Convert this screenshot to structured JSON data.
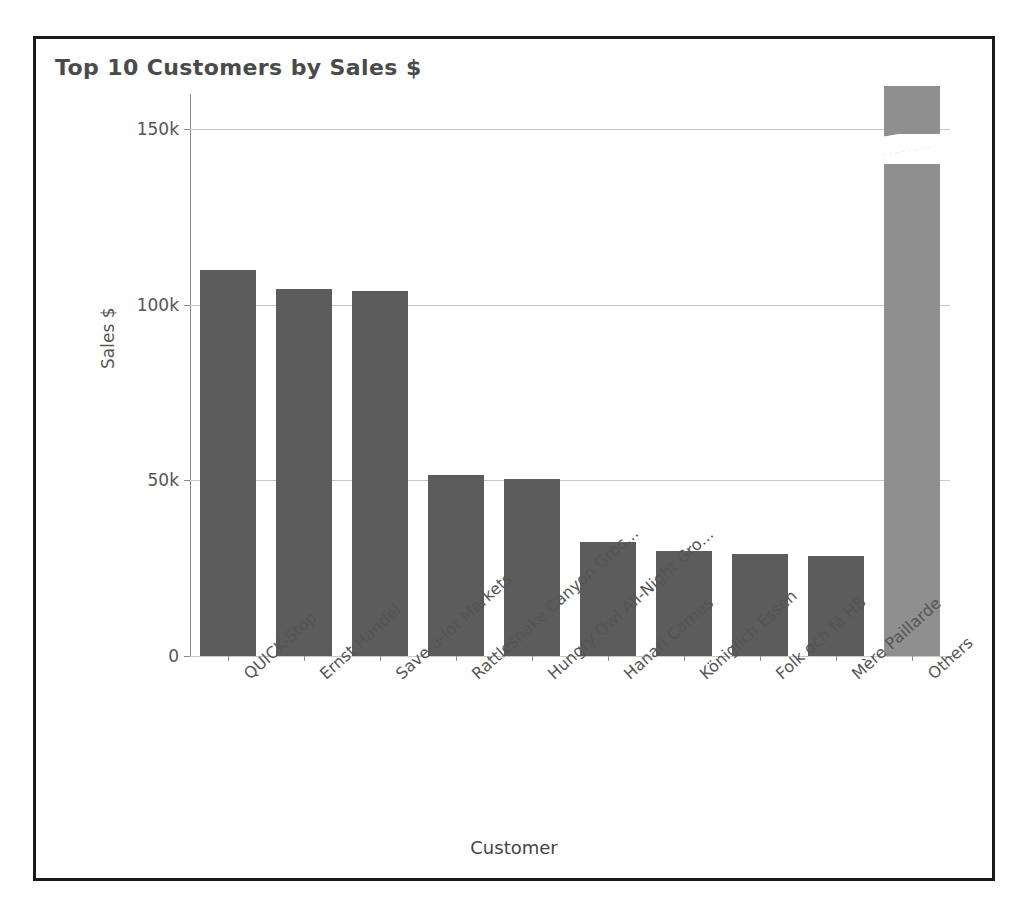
{
  "chart_data": {
    "type": "bar",
    "title": "Top 10 Customers by Sales $",
    "xlabel": "Customer",
    "ylabel": "Sales $",
    "categories": [
      "QUICK-Stop",
      "Ernst Handel",
      "Save-a-lot Markets",
      "Rattlesnake Canyon Groc...",
      "Hungry Owl All-Night Gro...",
      "Hanari Carnes",
      "Königlich Essen",
      "Folk och fä HB",
      "Mère Paillarde",
      "Others"
    ],
    "values": [
      110000,
      104500,
      104000,
      51500,
      50500,
      32500,
      30000,
      29000,
      28500,
      465000
    ],
    "ylim": [
      0,
      160000
    ],
    "yticks": [
      0,
      50000,
      100000,
      150000
    ],
    "ytick_labels": [
      "0",
      "50k",
      "100k",
      "150k"
    ],
    "grid": true,
    "legend": "none",
    "bar_color": "#5c5c5c",
    "accent_bar_color": "#8f8f8f",
    "accent_category": "Others",
    "annotations": [
      "The 'Others' bar is truncated with an axis-break notch near the top of the plot."
    ]
  }
}
